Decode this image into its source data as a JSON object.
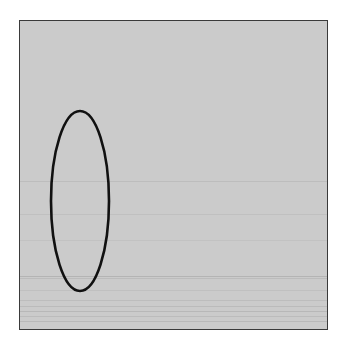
{
  "image": {
    "background": "#ffffff",
    "panel": {
      "x": 19,
      "y": 20,
      "width": 308,
      "height": 309,
      "fill": "#cbcbcb",
      "border": "#3a3a3a"
    },
    "ellipse": {
      "cx": 80,
      "cy": 201,
      "rx": 29,
      "ry": 90,
      "stroke": "#111111",
      "stroke_width": 2.6
    },
    "scanlines": [
      {
        "y": 181,
        "color": "#bdbdbd"
      },
      {
        "y": 214,
        "color": "#c0c0c0"
      },
      {
        "y": 240,
        "color": "#c2c2c2"
      },
      {
        "y": 276,
        "color": "#b4b4b4"
      },
      {
        "y": 278,
        "color": "#bcbcbc"
      },
      {
        "y": 290,
        "color": "#c0c0c0"
      },
      {
        "y": 300,
        "color": "#bdbdbd"
      },
      {
        "y": 306,
        "color": "#bbbbbb"
      },
      {
        "y": 311,
        "color": "#b8b8b8"
      },
      {
        "y": 316,
        "color": "#bcbcbc"
      },
      {
        "y": 321,
        "color": "#b9b9b9"
      }
    ]
  }
}
